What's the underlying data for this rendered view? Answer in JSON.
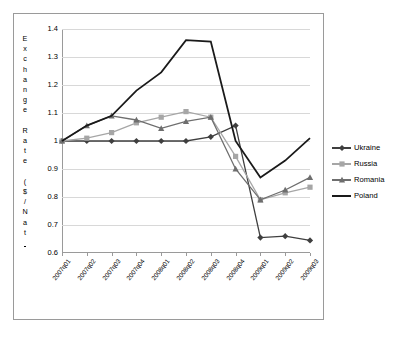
{
  "chart_data": {
    "type": "line",
    "title": "",
    "xlabel": "",
    "ylabel": "Exchange Rate ($/Nat)",
    "ylabel_chars": [
      "E",
      "x",
      "c",
      "h",
      "a",
      "n",
      "g",
      "e",
      "",
      "R",
      "a",
      "t",
      "e",
      "",
      "(",
      "$",
      "/",
      "N",
      "a",
      "t",
      ")"
    ],
    "categories": [
      "2007q01",
      "2007q02",
      "2007q03",
      "2007q04",
      "2008q01",
      "2008q02",
      "2008q03",
      "2008q04",
      "2009q01",
      "2009q02",
      "2009q03"
    ],
    "ylim": [
      0.6,
      1.4
    ],
    "ytick_labels": [
      "1.4",
      "1.3",
      "1.2",
      "1.1",
      "1",
      "0.9",
      "0.8",
      "0.7",
      "0.6"
    ],
    "ytick_values": [
      1.4,
      1.3,
      1.2,
      1.1,
      1.0,
      0.9,
      0.8,
      0.7,
      0.6
    ],
    "grid": true,
    "legend_position": "right",
    "series": [
      {
        "name": "Ukraine",
        "color": "#3f3f3f",
        "marker": "diamond",
        "values": [
          1.0,
          1.0,
          1.0,
          1.0,
          1.0,
          1.0,
          1.015,
          1.055,
          0.655,
          0.66,
          0.645
        ]
      },
      {
        "name": "Russia",
        "color": "#a6a6a6",
        "marker": "square",
        "values": [
          1.0,
          1.01,
          1.03,
          1.065,
          1.085,
          1.105,
          1.085,
          0.945,
          0.79,
          0.815,
          0.835
        ]
      },
      {
        "name": "Romania",
        "color": "#6e6e6e",
        "marker": "triangle",
        "values": [
          1.0,
          1.055,
          1.09,
          1.075,
          1.045,
          1.07,
          1.085,
          0.9,
          0.79,
          0.825,
          0.87
        ]
      },
      {
        "name": "Poland",
        "color": "#1a1a1a",
        "marker": "none",
        "values": [
          1.0,
          1.055,
          1.09,
          1.18,
          1.245,
          1.36,
          1.355,
          1.0,
          0.87,
          0.93,
          1.01
        ]
      }
    ]
  },
  "legend": {
    "items": [
      {
        "label": "Ukraine"
      },
      {
        "label": "Russia"
      },
      {
        "label": "Romania"
      },
      {
        "label": "Poland"
      }
    ]
  }
}
